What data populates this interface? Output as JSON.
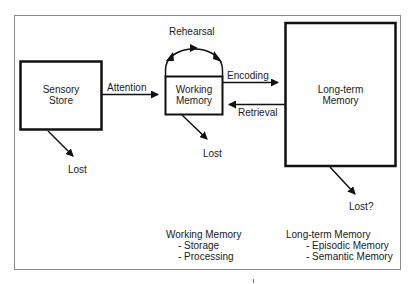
{
  "diagram": {
    "type": "memory-model-flowchart",
    "colors": {
      "stroke": "#111111",
      "frame": "#8a8a8a",
      "text": "#1a1a1a",
      "background": "#ffffff"
    },
    "nodes": {
      "sensory_store": {
        "line1": "Sensory",
        "line2": "Store"
      },
      "working_memory": {
        "line1": "Working",
        "line2": "Memory"
      },
      "long_term_memory": {
        "line1": "Long-term",
        "line2": "Memory"
      }
    },
    "edges": {
      "attention": "Attention",
      "rehearsal": "Rehearsal",
      "encoding": "Encoding",
      "retrieval": "Retrieval"
    },
    "lost_labels": {
      "sensory": "Lost",
      "working": "Lost",
      "long_term": "Lost?"
    },
    "notes": {
      "working_memory": {
        "title": "Working Memory",
        "items": [
          "- Storage",
          "- Processing"
        ]
      },
      "long_term_memory": {
        "title": "Long-term Memory",
        "items": [
          "- Episodic Memory",
          "- Semantic Memory"
        ]
      }
    }
  }
}
